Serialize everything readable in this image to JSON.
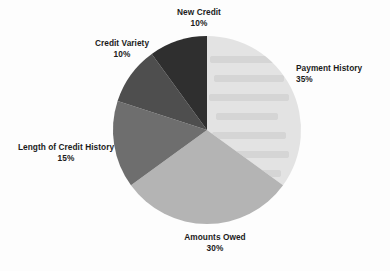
{
  "page": {
    "background_color": "#fdfdfd",
    "text_color": "#1b1b1b"
  },
  "chart_data": {
    "type": "pie",
    "title": "",
    "subtitle": "",
    "xlabel": "",
    "ylabel": "",
    "legend_position": "none",
    "labels_position": "outside-callout",
    "grid": false,
    "start_angle_deg": 0,
    "direction": "clockwise",
    "units": "percent",
    "total": 100,
    "categories": [
      "Payment History",
      "Amounts Owed",
      "Length of Credit History",
      "Credit Variety",
      "New Credit"
    ],
    "values": [
      35,
      30,
      15,
      10,
      10
    ],
    "value_labels": [
      "35%",
      "30%",
      "15%",
      "10%",
      "10%"
    ],
    "colors": [
      "#e3e3e3",
      "#b4b4b4",
      "#6e6e6e",
      "#4e4e4e",
      "#2f2f2f"
    ],
    "slices": [
      {
        "name": "Payment History",
        "value": 35,
        "value_label": "35%",
        "color": "#e3e3e3",
        "start_deg": 0,
        "end_deg": 126
      },
      {
        "name": "Amounts Owed",
        "value": 30,
        "value_label": "30%",
        "color": "#b4b4b4",
        "start_deg": 126,
        "end_deg": 234
      },
      {
        "name": "Length of Credit History",
        "value": 15,
        "value_label": "15%",
        "color": "#6e6e6e",
        "start_deg": 234,
        "end_deg": 288
      },
      {
        "name": "Credit Variety",
        "value": 10,
        "value_label": "10%",
        "color": "#4e4e4e",
        "start_deg": 288,
        "end_deg": 324
      },
      {
        "name": "New Credit",
        "value": 10,
        "value_label": "10%",
        "color": "#2f2f2f",
        "start_deg": 324,
        "end_deg": 360
      }
    ]
  },
  "labels": {
    "payment_history": {
      "name": "Payment History",
      "percent": "35%"
    },
    "amounts_owed": {
      "name": "Amounts Owed",
      "percent": "30%"
    },
    "length_of_credit_history": {
      "name": "Length of Credit History",
      "percent": "15%"
    },
    "credit_variety": {
      "name": "Credit Variety",
      "percent": "10%"
    },
    "new_credit": {
      "name": "New Credit",
      "percent": "10%"
    }
  }
}
